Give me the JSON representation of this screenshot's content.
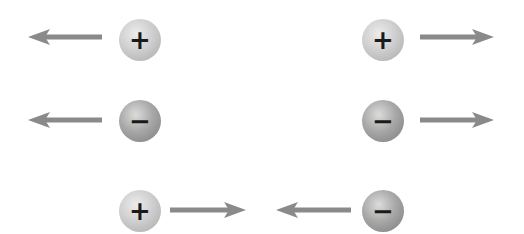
{
  "diagram": {
    "title": "",
    "colors": {
      "arrow": "#8a8a8a",
      "positive_sphere": "#cfcfcf",
      "negative_sphere": "#a8a8a8",
      "sign": "#1a1a1a"
    },
    "charges": [
      {
        "id": "c1",
        "sign": "+",
        "type": "positive",
        "cx": 140,
        "cy": 40
      },
      {
        "id": "c2",
        "sign": "+",
        "type": "positive",
        "cx": 383,
        "cy": 40
      },
      {
        "id": "c3",
        "sign": "−",
        "type": "negative",
        "cx": 140,
        "cy": 121
      },
      {
        "id": "c4",
        "sign": "−",
        "type": "negative",
        "cx": 383,
        "cy": 121
      },
      {
        "id": "c5",
        "sign": "+",
        "type": "positive",
        "cx": 140,
        "cy": 211
      },
      {
        "id": "c6",
        "sign": "−",
        "type": "negative",
        "cx": 383,
        "cy": 211
      }
    ],
    "arrows": [
      {
        "id": "a1",
        "direction": "left",
        "x1": 102,
        "x2": 28,
        "y": 37
      },
      {
        "id": "a2",
        "direction": "right",
        "x1": 420,
        "x2": 493,
        "y": 37
      },
      {
        "id": "a3",
        "direction": "left",
        "x1": 102,
        "x2": 28,
        "y": 120
      },
      {
        "id": "a4",
        "direction": "right",
        "x1": 420,
        "x2": 493,
        "y": 120
      },
      {
        "id": "a5",
        "direction": "right",
        "x1": 170,
        "x2": 246,
        "y": 210
      },
      {
        "id": "a6",
        "direction": "left",
        "x1": 351,
        "x2": 276,
        "y": 210
      }
    ],
    "rows": [
      {
        "label": "like charges (+,+) repel"
      },
      {
        "label": "like charges (−,−) repel"
      },
      {
        "label": "unlike charges (+,−) attract"
      }
    ]
  }
}
